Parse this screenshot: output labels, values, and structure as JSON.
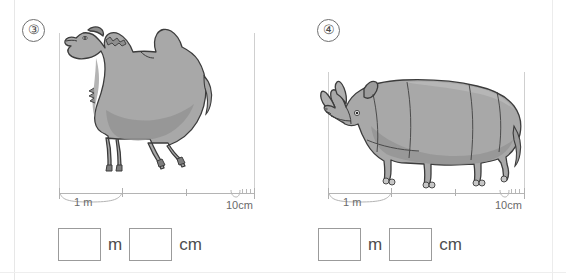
{
  "worksheet": {
    "type": "measurement-exercise",
    "background_color": "#ffffff",
    "animal_fill_color": "#a8a8a8",
    "animal_shade_color": "#949494",
    "animal_outline_color": "#3c3c3c",
    "rule_color": "#b4b4b4"
  },
  "problems": [
    {
      "number": "③",
      "number_plain": "3",
      "animal": "camel",
      "animal_name": "two-humped-camel",
      "scale": {
        "major_label": "1 m",
        "minor_label": "10cm",
        "major_ticks": 3,
        "minor_ticks": 4
      },
      "answer": {
        "box1_value": "",
        "unit1": "m",
        "box2_value": "",
        "unit2": "cm"
      }
    },
    {
      "number": "④",
      "number_plain": "4",
      "animal": "rhinoceros",
      "animal_name": "rhinoceros",
      "scale": {
        "major_label": "1 m",
        "minor_label": "10cm",
        "major_ticks": 3,
        "minor_ticks": 4
      },
      "answer": {
        "box1_value": "",
        "unit1": "m",
        "box2_value": "",
        "unit2": "cm"
      }
    }
  ]
}
